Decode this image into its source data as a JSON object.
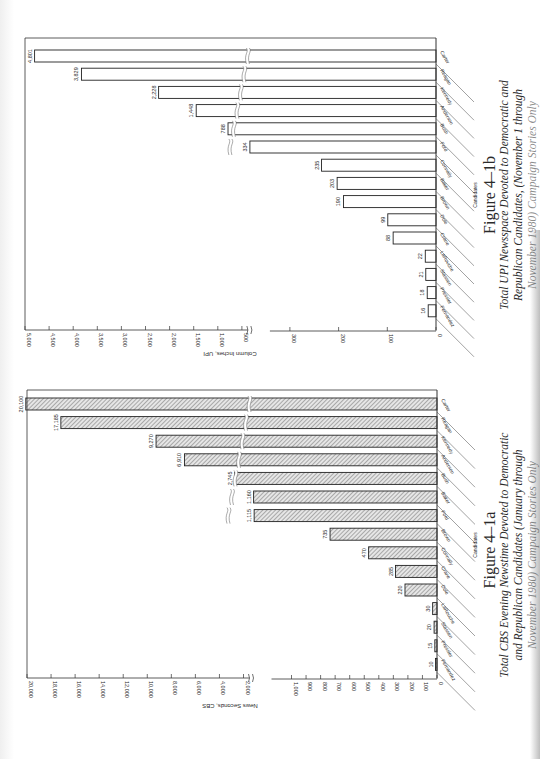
{
  "chart_data": [
    {
      "type": "bar",
      "orientation": "horizontal",
      "figure_label": "Figure 4–1b",
      "title": "Total UPI Newsspace Devoted to Democratic and Republican Candidates, (November 1 through November 1980) Campaign Stories Only",
      "caption_lines": [
        "Total UPI Newsspace Devoted to Democratic and",
        "Republican Candidates, (November 1 through",
        "November 1980) Campaign Stories Only"
      ],
      "xlabel": "Candidates",
      "ylabel": "Column Inches, UPI",
      "fill": "outline",
      "categories": [
        "Carter",
        "Reagan",
        "Kennedy",
        "Anderson",
        "Bush",
        "Ford",
        "Connally",
        "Baker",
        "Brown",
        "Dole",
        "Crane",
        "LaRouche",
        "Stassen",
        "Pressler",
        "Fernandez"
      ],
      "values": [
        4801,
        3829,
        2228,
        1448,
        788,
        334,
        235,
        203,
        190,
        99,
        88,
        22,
        21,
        18,
        16
      ],
      "value_labels": [
        "4,801",
        "3,829",
        "2,228",
        "1,448",
        "788",
        "334",
        "235",
        "203",
        "190",
        "99",
        "88",
        "22",
        "21",
        "18",
        "16"
      ],
      "axis_break": {
        "from": 300,
        "to": 500
      },
      "ylim": [
        0,
        5000
      ],
      "ticks_low": [
        {
          "v": 0,
          "label": "0"
        },
        {
          "v": 100,
          "label": "100"
        },
        {
          "v": 200,
          "label": "200"
        },
        {
          "v": 300,
          "label": "300"
        }
      ],
      "ticks_high": [
        {
          "v": 500,
          "label": "500"
        },
        {
          "v": 1000,
          "label": "1,000"
        },
        {
          "v": 1500,
          "label": "1,500"
        },
        {
          "v": 2000,
          "label": "2,000"
        },
        {
          "v": 2500,
          "label": "2,500"
        },
        {
          "v": 3000,
          "label": "3,000"
        },
        {
          "v": 3500,
          "label": "3,500"
        },
        {
          "v": 4000,
          "label": "4,000"
        },
        {
          "v": 4500,
          "label": "4,500"
        },
        {
          "v": 5000,
          "label": "5,000"
        }
      ],
      "grid": false
    },
    {
      "type": "bar",
      "orientation": "horizontal",
      "figure_label": "Figure 4–1a",
      "title": "Total CBS Evening Newstime Devoted to Democratic and Republican Candidates (January through November 1980) Campaign Stories Only",
      "caption_lines": [
        "Total CBS Evening Newstime Devoted to Democratic",
        "and Republican Candidates (January through",
        "November 1980) Campaign Stories Only"
      ],
      "xlabel": "Candidates",
      "ylabel": "News Seconds, CBS",
      "fill": "hatched",
      "categories": [
        "Carter",
        "Reagan",
        "Kennedy",
        "Anderson",
        "Bush",
        "Baker",
        "Ford",
        "Brown",
        "Connally",
        "Crane",
        "Dole",
        "LaRouche",
        "Stassen",
        "Pressler",
        "Fernandez"
      ],
      "values": [
        20100,
        17185,
        9270,
        6910,
        2745,
        1160,
        1115,
        735,
        470,
        285,
        220,
        30,
        20,
        15,
        10
      ],
      "value_labels": [
        "20,100",
        "17,185",
        "9,270",
        "6,910",
        "2,745",
        "1,160",
        "1,115",
        "735",
        "470",
        "285",
        "220",
        "30",
        "20",
        "15",
        "10"
      ],
      "axis_break": {
        "from": 1000,
        "to": 2000
      },
      "ylim": [
        0,
        20000
      ],
      "ticks_low": [
        {
          "v": 0,
          "label": "0"
        },
        {
          "v": 100,
          "label": "100"
        },
        {
          "v": 200,
          "label": "200"
        },
        {
          "v": 300,
          "label": "300"
        },
        {
          "v": 400,
          "label": "400"
        },
        {
          "v": 500,
          "label": "500"
        },
        {
          "v": 600,
          "label": "600"
        },
        {
          "v": 700,
          "label": "700"
        },
        {
          "v": 800,
          "label": "800"
        },
        {
          "v": 900,
          "label": "900"
        },
        {
          "v": 1000,
          "label": "1,000"
        }
      ],
      "ticks_high": [
        {
          "v": 2000,
          "label": "2,000"
        },
        {
          "v": 4000,
          "label": "4,000"
        },
        {
          "v": 6000,
          "label": "6,000"
        },
        {
          "v": 8000,
          "label": "8,000"
        },
        {
          "v": 10000,
          "label": "10,000"
        },
        {
          "v": 12000,
          "label": "12,000"
        },
        {
          "v": 14000,
          "label": "14,000"
        },
        {
          "v": 16000,
          "label": "16,000"
        },
        {
          "v": 18000,
          "label": "18,000"
        },
        {
          "v": 20000,
          "label": "20,000"
        }
      ],
      "grid": false
    }
  ]
}
